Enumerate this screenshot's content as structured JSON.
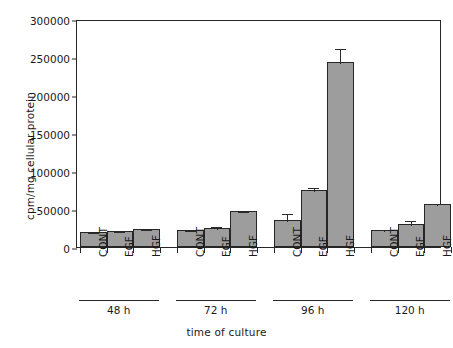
{
  "chart_data": {
    "type": "bar",
    "title": "",
    "xlabel": "time of culture",
    "ylabel": "cpm/mg cellular protein",
    "ylim": [
      0,
      300000
    ],
    "yticks": [
      0,
      50000,
      100000,
      150000,
      200000,
      250000,
      300000
    ],
    "ytick_labels": [
      "0",
      "50000",
      "100000",
      "150000",
      "200000",
      "250000",
      "300000"
    ],
    "grid": false,
    "legend": "none",
    "group_labels": [
      "48 h",
      "72 h",
      "96 h",
      "120 h"
    ],
    "categories": [
      "CONT",
      "EGF",
      "HGF"
    ],
    "groups": [
      {
        "label": "48 h",
        "bars": [
          {
            "category": "CONT",
            "value": 20000,
            "error": 1500
          },
          {
            "category": "EGF",
            "value": 21000,
            "error": 1500
          },
          {
            "category": "HGF",
            "value": 24000,
            "error": 1500
          }
        ]
      },
      {
        "label": "72 h",
        "bars": [
          {
            "category": "CONT",
            "value": 22000,
            "error": 2000
          },
          {
            "category": "EGF",
            "value": 25000,
            "error": 4500
          },
          {
            "category": "HGF",
            "value": 47000,
            "error": 2000
          }
        ]
      },
      {
        "label": "96 h",
        "bars": [
          {
            "category": "CONT",
            "value": 36000,
            "error": 10500
          },
          {
            "category": "EGF",
            "value": 75000,
            "error": 5500
          },
          {
            "category": "HGF",
            "value": 243000,
            "error": 20000
          }
        ]
      },
      {
        "label": "120 h",
        "bars": [
          {
            "category": "CONT",
            "value": 23000,
            "error": 2000
          },
          {
            "category": "EGF",
            "value": 30000,
            "error": 7000
          },
          {
            "category": "HGF",
            "value": 56000,
            "error": 3500
          }
        ]
      }
    ],
    "colors": {
      "bar_fill": "#9d9d9d",
      "bar_edge": "#262626",
      "axis": "#262626",
      "text": "#1a1a1a",
      "background": "#ffffff"
    }
  }
}
